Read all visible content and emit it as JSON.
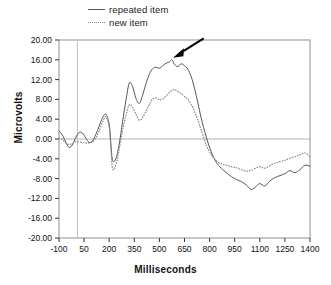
{
  "legend": {
    "position": "top-center",
    "entries": [
      {
        "label": "repeated item",
        "style": "solid",
        "color": "#555555",
        "icon": "line-solid-icon"
      },
      {
        "label": "new item",
        "style": "dotted",
        "color": "#8a8a8a",
        "icon": "line-dotted-icon"
      }
    ]
  },
  "axes": {
    "xlabel": "Milliseconds",
    "ylabel": "Microvolts"
  },
  "annotation": {
    "name": "arrow-pointer",
    "description": "black arrow pointing to peak of repeated item curve",
    "target_x": 575,
    "target_y": 16.0
  },
  "chart_data": {
    "type": "line",
    "title": "",
    "xlabel": "Milliseconds",
    "ylabel": "Microvolts",
    "xlim": [
      -100,
      1400
    ],
    "ylim": [
      -20.0,
      20.0
    ],
    "xticks": [
      -100,
      50,
      200,
      350,
      500,
      650,
      800,
      950,
      1100,
      1250,
      1400
    ],
    "xticklabels": [
      "-100",
      "50",
      "200",
      "350",
      "500",
      "650",
      "800",
      "950",
      "1100",
      "1250",
      "1400"
    ],
    "yticks": [
      20.0,
      16.0,
      12.0,
      8.0,
      4.0,
      0.0,
      -4.0,
      -8.0,
      -12.0,
      -16.0,
      -20.0
    ],
    "yticklabels": [
      "20.00",
      "16.00",
      "12.00",
      "8.00",
      "4.00",
      "0.00",
      "-4.00",
      "-8.00",
      "-12.00",
      "-16.00",
      "-20.00"
    ],
    "grid": false,
    "zero_line": 0.0,
    "stimulus_onset_line": 10,
    "legend_position": "above-axes",
    "series": [
      {
        "name": "repeated item",
        "style": "solid",
        "color": "#555555",
        "x": [
          -100,
          -80,
          -60,
          -40,
          -20,
          0,
          20,
          40,
          60,
          80,
          100,
          120,
          140,
          160,
          180,
          200,
          210,
          220,
          240,
          260,
          280,
          300,
          320,
          340,
          360,
          380,
          400,
          420,
          440,
          460,
          480,
          500,
          520,
          540,
          560,
          575,
          590,
          610,
          630,
          650,
          670,
          690,
          710,
          730,
          750,
          780,
          810,
          840,
          870,
          900,
          930,
          960,
          990,
          1020,
          1050,
          1080,
          1100,
          1130,
          1160,
          1190,
          1220,
          1250,
          1280,
          1310,
          1340,
          1370,
          1400
        ],
        "y": [
          1.6,
          0.8,
          -0.6,
          -1.7,
          -1.2,
          0.3,
          1.3,
          1.2,
          0.2,
          -0.7,
          -0.4,
          0.9,
          2.6,
          4.3,
          5.0,
          3.0,
          -1.0,
          -4.3,
          -4.0,
          -1.0,
          3.5,
          7.8,
          11.3,
          10.6,
          8.2,
          7.2,
          8.9,
          11.2,
          13.1,
          14.2,
          14.5,
          14.3,
          14.8,
          15.3,
          15.6,
          16.0,
          15.1,
          14.6,
          15.2,
          14.8,
          14.1,
          12.6,
          10.2,
          7.3,
          4.2,
          0.4,
          -2.6,
          -4.7,
          -5.9,
          -6.8,
          -7.6,
          -8.2,
          -8.6,
          -9.3,
          -10.2,
          -9.5,
          -9.0,
          -9.5,
          -8.5,
          -7.8,
          -7.4,
          -7.0,
          -6.4,
          -6.8,
          -6.2,
          -5.3,
          -5.5
        ]
      },
      {
        "name": "new item",
        "style": "dotted",
        "color": "#8a8a8a",
        "x": [
          -100,
          -80,
          -60,
          -40,
          -20,
          0,
          20,
          40,
          60,
          80,
          100,
          120,
          140,
          160,
          180,
          200,
          210,
          220,
          240,
          260,
          280,
          300,
          320,
          340,
          360,
          380,
          400,
          420,
          440,
          460,
          480,
          500,
          520,
          540,
          560,
          575,
          590,
          610,
          630,
          650,
          670,
          690,
          710,
          730,
          750,
          780,
          810,
          840,
          870,
          900,
          930,
          960,
          990,
          1020,
          1050,
          1080,
          1100,
          1130,
          1160,
          1190,
          1220,
          1250,
          1280,
          1310,
          1340,
          1370,
          1400
        ],
        "y": [
          0.2,
          -0.1,
          -0.8,
          -1.1,
          -0.9,
          -0.5,
          -0.6,
          -0.7,
          -0.8,
          -0.8,
          -0.6,
          0.2,
          1.6,
          3.4,
          4.5,
          2.4,
          -1.8,
          -6.0,
          -5.2,
          -2.0,
          1.8,
          4.8,
          6.9,
          6.4,
          5.0,
          3.8,
          4.4,
          5.6,
          7.0,
          8.1,
          8.3,
          7.9,
          8.1,
          8.7,
          9.4,
          9.8,
          10.0,
          9.6,
          9.2,
          8.6,
          8.0,
          7.0,
          5.6,
          3.8,
          1.8,
          -1.2,
          -3.2,
          -4.4,
          -5.0,
          -5.3,
          -5.6,
          -5.8,
          -6.2,
          -6.5,
          -6.3,
          -5.8,
          -5.6,
          -5.9,
          -5.4,
          -4.9,
          -4.6,
          -4.3,
          -3.9,
          -3.6,
          -3.2,
          -2.8,
          -3.6
        ]
      }
    ]
  }
}
